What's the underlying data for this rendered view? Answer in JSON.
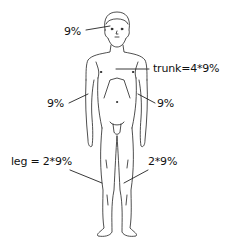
{
  "diagram": {
    "type": "body-surface-area-rule-of-nines",
    "labels": {
      "head": "9%",
      "trunk": "trunk=4*9%",
      "left_arm": "9%",
      "right_arm": "9%",
      "left_leg": "leg = 2*9%",
      "right_leg": "2*9%"
    },
    "colors": {
      "line": "#222222",
      "background": "#ffffff"
    }
  }
}
